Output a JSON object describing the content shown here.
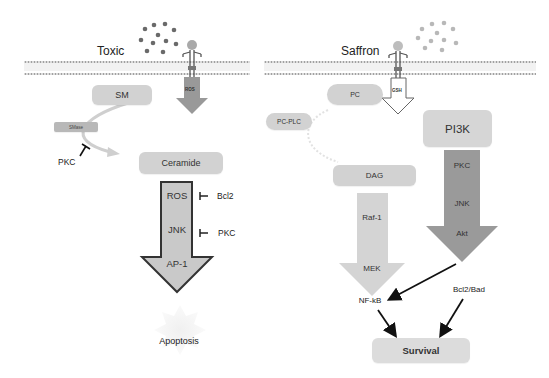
{
  "left_panel": {
    "title": "Toxic",
    "receptor_label": "ROS",
    "sm": "SM",
    "smase": "SMase",
    "pkc_inhibitor": "PKC",
    "ceramide": "Ceramide",
    "arrow_steps": [
      "ROS",
      "JNK",
      "AP-1"
    ],
    "side_inhibitors": [
      "Bcl2",
      "PKC"
    ],
    "outcome": "Apoptosis"
  },
  "right_panel": {
    "title": "Saffron",
    "receptor_label": "GSH",
    "pc": "PC",
    "pc_plc": "PC-PLC",
    "pi3k": "PI3K",
    "pi3k_steps": [
      "PKC",
      "JNK",
      "Akt"
    ],
    "dag": "DAG",
    "dag_steps": [
      "Raf-1",
      "MEK"
    ],
    "nfkb": "NF-kB",
    "bcl2bad": "Bcl2/Bad",
    "outcome": "Survival"
  },
  "colors": {
    "toxic_particles": "#6a6a6a",
    "saffron_particles": "#b8b8b8",
    "box_fill": "#d2d2d2",
    "pi3k_arrow": "#9a9a9a",
    "dag_arrow": "#d4d4d4",
    "membrane": "#a8a8a8"
  }
}
